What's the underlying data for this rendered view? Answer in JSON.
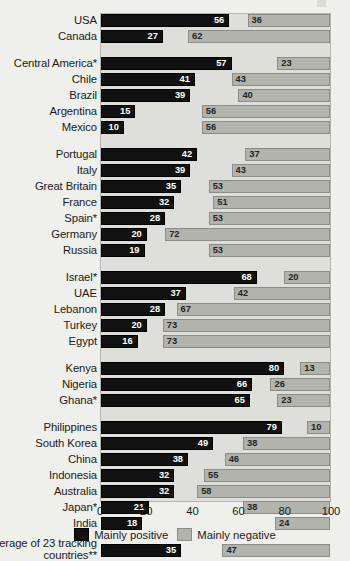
{
  "chart_data": {
    "type": "bar",
    "orientation": "horizontal",
    "title": "",
    "xlabel": "",
    "ylabel": "",
    "xlim": [
      0,
      100
    ],
    "xticks": [
      "0",
      "20",
      "40",
      "60",
      "80",
      "100"
    ],
    "grid": false,
    "legend_position": "bottom-center",
    "stacking": "positive-from-left-negative-from-right",
    "series": [
      {
        "name": "Mainly positive",
        "color": "#111111"
      },
      {
        "name": "Mainly negative",
        "color": "#b3b3ae"
      }
    ],
    "categories": [
      "USA",
      "Canada",
      "Central America*",
      "Chile",
      "Brazil",
      "Argentina",
      "Mexico",
      "Portugal",
      "Italy",
      "Great Britain",
      "France",
      "Spain*",
      "Germany",
      "Russia",
      "Israel*",
      "UAE",
      "Lebanon",
      "Turkey",
      "Egypt",
      "Kenya",
      "Nigeria",
      "Ghana*",
      "Philippines",
      "South Korea",
      "China",
      "Indonesia",
      "Australia",
      "Japan*",
      "India",
      "Average of 23 tracking countries**"
    ],
    "positive": [
      56,
      27,
      57,
      41,
      39,
      15,
      10,
      42,
      39,
      35,
      32,
      28,
      20,
      19,
      68,
      37,
      28,
      20,
      16,
      80,
      66,
      65,
      79,
      49,
      38,
      32,
      32,
      21,
      18,
      35
    ],
    "negative": [
      36,
      62,
      23,
      43,
      40,
      56,
      56,
      37,
      43,
      53,
      51,
      53,
      72,
      53,
      20,
      42,
      67,
      73,
      73,
      13,
      26,
      23,
      10,
      38,
      46,
      55,
      58,
      38,
      24,
      47
    ]
  },
  "rows": [
    {
      "label": "USA",
      "pos": 56,
      "neg": 36
    },
    {
      "label": "Canada",
      "pos": 27,
      "neg": 62
    },
    {
      "gap": true
    },
    {
      "label": "Central America*",
      "pos": 57,
      "neg": 23
    },
    {
      "label": "Chile",
      "pos": 41,
      "neg": 43
    },
    {
      "label": "Brazil",
      "pos": 39,
      "neg": 40
    },
    {
      "label": "Argentina",
      "pos": 15,
      "neg": 56
    },
    {
      "label": "Mexico",
      "pos": 10,
      "neg": 56
    },
    {
      "gap": true
    },
    {
      "label": "Portugal",
      "pos": 42,
      "neg": 37
    },
    {
      "label": "Italy",
      "pos": 39,
      "neg": 43
    },
    {
      "label": "Great Britain",
      "pos": 35,
      "neg": 53
    },
    {
      "label": "France",
      "pos": 32,
      "neg": 51
    },
    {
      "label": "Spain*",
      "pos": 28,
      "neg": 53
    },
    {
      "label": "Germany",
      "pos": 20,
      "neg": 72
    },
    {
      "label": "Russia",
      "pos": 19,
      "neg": 53
    },
    {
      "gap": true
    },
    {
      "label": "Israel*",
      "pos": 68,
      "neg": 20
    },
    {
      "label": "UAE",
      "pos": 37,
      "neg": 42
    },
    {
      "label": "Lebanon",
      "pos": 28,
      "neg": 67
    },
    {
      "label": "Turkey",
      "pos": 20,
      "neg": 73
    },
    {
      "label": "Egypt",
      "pos": 16,
      "neg": 73
    },
    {
      "gap": true
    },
    {
      "label": "Kenya",
      "pos": 80,
      "neg": 13
    },
    {
      "label": "Nigeria",
      "pos": 66,
      "neg": 26
    },
    {
      "label": "Ghana*",
      "pos": 65,
      "neg": 23
    },
    {
      "gap": true
    },
    {
      "label": "Philippines",
      "pos": 79,
      "neg": 10
    },
    {
      "label": "South Korea",
      "pos": 49,
      "neg": 38
    },
    {
      "label": "China",
      "pos": 38,
      "neg": 46
    },
    {
      "label": "Indonesia",
      "pos": 32,
      "neg": 55
    },
    {
      "label": "Australia",
      "pos": 32,
      "neg": 58
    },
    {
      "label": "Japan*",
      "pos": 21,
      "neg": 38
    },
    {
      "label": "India",
      "pos": 18,
      "neg": 24
    },
    {
      "gap": true
    },
    {
      "label": "Average of 23 tracking countries**",
      "pos": 35,
      "neg": 47,
      "twoLine": true
    }
  ],
  "axis": {
    "ticks": [
      {
        "value": 0,
        "label": "0"
      },
      {
        "value": 20,
        "label": "20"
      },
      {
        "value": 40,
        "label": "40"
      },
      {
        "value": 60,
        "label": "60"
      },
      {
        "value": 80,
        "label": "80"
      },
      {
        "value": 100,
        "label": "100"
      }
    ]
  },
  "legend": {
    "items": [
      {
        "label": "Mainly positive",
        "kind": "pos"
      },
      {
        "label": "Mainly negative",
        "kind": "neg"
      }
    ]
  }
}
